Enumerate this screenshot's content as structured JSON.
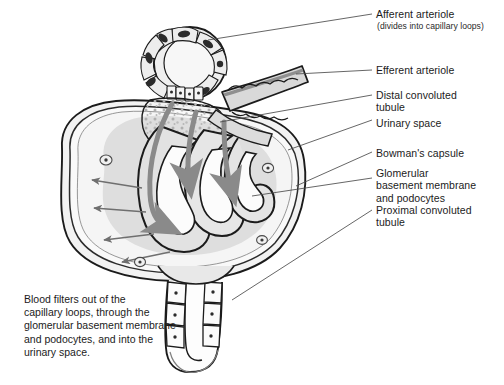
{
  "figure": {
    "type": "anatomical-line-diagram",
    "background_color": "#ffffff",
    "ink_color": "#1b1b1b",
    "tissue_fill": "#e6e6e6",
    "capsule_fill": "#f0f0f0",
    "flow_arrow_color": "#8a8a8a",
    "filtration_arrow_color": "#6f6f6f",
    "stipple_color": "#b4b4b4"
  },
  "labels": {
    "afferent": "Afferent arteriole",
    "afferent_sub": "(divides into capillary loops)",
    "efferent": "Efferent arteriole",
    "distal": "Distal convoluted\ntubule",
    "urinary": "Urinary space",
    "bowman": "Bowman's capsule",
    "gbm": "Glomerular\nbasement membrane\nand podocytes",
    "proximal": "Proximal convoluted\ntubule"
  },
  "caption": {
    "blood_filters": "Blood filters out of the\ncapillary loops, through the\nglomerular basement membrane\nand podocytes, and into the\nurinary space."
  },
  "structures": [
    {
      "name": "afferent-arteriole",
      "note": "cross-sectioned vessel with ring of smooth muscle cells containing dark nuclei"
    },
    {
      "name": "efferent-arteriole",
      "note": "vessel exiting to the upper right"
    },
    {
      "name": "macula-densa",
      "note": "row of small cuboidal cells at base of arteriole cross-section"
    },
    {
      "name": "capillary-loops",
      "note": "four interlocking glomerular capillary loops"
    },
    {
      "name": "bowmans-capsule",
      "note": "double-walled outer capsule enclosing the tuft"
    },
    {
      "name": "urinary-space",
      "note": "clear space between visceral and parietal layers"
    },
    {
      "name": "proximal-convoluted-tubule",
      "note": "tubule of cuboidal cells descending from capsule base"
    },
    {
      "name": "blood-flow-arrows",
      "count": 3
    },
    {
      "name": "filtration-arrows",
      "count": 4
    }
  ]
}
